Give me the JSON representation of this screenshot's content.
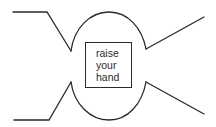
{
  "diagram": {
    "type": "symbol-diagram",
    "label": {
      "lines": [
        "raise",
        "your",
        "hand"
      ]
    },
    "colors": {
      "stroke": "#2a2a2a",
      "background": "#ffffff"
    }
  }
}
